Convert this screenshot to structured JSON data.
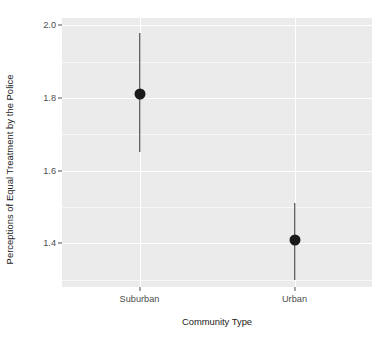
{
  "chart_data": {
    "type": "scatter",
    "title": "",
    "subtitle": "",
    "xlabel": "Community Type",
    "ylabel": "Perceptions of Equal Treatment by the Police",
    "categories": [
      "Suburban",
      "Urban"
    ],
    "values": [
      1.81,
      1.41
    ],
    "error_low": [
      1.65,
      1.3
    ],
    "error_high": [
      1.98,
      1.51
    ],
    "series": [
      {
        "name": "Estimated mean with 95% confidence interval",
        "points": [
          {
            "category": "Suburban",
            "value": 1.81,
            "ci_low": 1.65,
            "ci_high": 1.98
          },
          {
            "category": "Urban",
            "value": 1.41,
            "ci_low": 1.3,
            "ci_high": 1.51
          }
        ]
      }
    ],
    "ylim": [
      1.28,
      2.02
    ],
    "xlim": [
      0.5,
      2.5
    ],
    "yticks": [
      2.0,
      1.8,
      1.6,
      1.4
    ],
    "ytick_labels": [
      "2.0",
      "1.8",
      "1.6",
      "1.4"
    ],
    "yticks_minor": [
      1.9,
      1.7,
      1.5,
      1.3
    ],
    "xtick_labels": [
      "Suburban",
      "Urban"
    ],
    "grid": true,
    "legend": "none",
    "marker": "filled-circle",
    "annotations": []
  },
  "style": {
    "panel_background": "#ebebeb",
    "gridline_major_color": "#ffffff",
    "gridline_minor_color": "#f7f7f7",
    "point_color": "#1a1a1a",
    "errorbar_color": "#2b2b2b",
    "axis_text_color": "#4d4d4d",
    "axis_title_color": "#1a1a1a",
    "plot_background": "#ffffff"
  }
}
